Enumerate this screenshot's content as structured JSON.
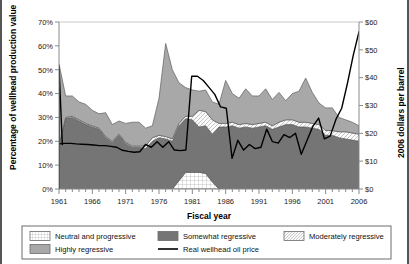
{
  "chart_data": {
    "type": "area",
    "title": "",
    "xlabel": "Fiscal year",
    "ylabel": "Percentage of wellhead production value",
    "y2label": "2006 dollars per barrel",
    "xlim": [
      1961,
      2006
    ],
    "ylim": [
      0,
      70
    ],
    "y2lim": [
      0,
      60
    ],
    "ytick_labels": [
      "0%",
      "10%",
      "20%",
      "30%",
      "40%",
      "50%",
      "60%",
      "70%"
    ],
    "ytick_values": [
      0,
      10,
      20,
      30,
      40,
      50,
      60,
      70
    ],
    "y2tick_labels": [
      "$0",
      "$10",
      "$20",
      "$30",
      "$40",
      "$50",
      "$60"
    ],
    "y2tick_values": [
      0,
      10,
      20,
      30,
      40,
      50,
      60
    ],
    "xtick_labels": [
      "1961",
      "1966",
      "1971",
      "1976",
      "1981",
      "1986",
      "1991",
      "1996",
      "2001",
      "2006"
    ],
    "xtick_values": [
      1961,
      1966,
      1971,
      1976,
      1981,
      1986,
      1991,
      1996,
      2001,
      2006
    ],
    "grid": false,
    "legend_position": "bottom",
    "stacked": true,
    "x": [
      1961,
      1962,
      1963,
      1964,
      1965,
      1966,
      1967,
      1968,
      1969,
      1970,
      1971,
      1972,
      1973,
      1974,
      1975,
      1976,
      1977,
      1978,
      1979,
      1980,
      1981,
      1982,
      1983,
      1984,
      1985,
      1986,
      1987,
      1988,
      1989,
      1990,
      1991,
      1992,
      1993,
      1994,
      1995,
      1996,
      1997,
      1998,
      1999,
      2000,
      2001,
      2002,
      2003,
      2004,
      2005,
      2006
    ],
    "series": [
      {
        "name": "Neutral and progressive",
        "fill": "#ffffff",
        "pattern": "grid",
        "values": [
          0,
          0,
          0,
          0,
          0,
          0,
          0,
          0,
          0,
          0,
          0,
          0,
          0,
          0,
          0,
          0,
          0,
          0,
          3.5,
          7,
          7,
          7,
          6.5,
          3,
          0,
          0,
          0,
          0,
          0,
          0,
          0,
          0,
          0,
          0,
          0,
          0,
          0,
          0,
          0,
          0,
          0,
          0,
          0,
          0,
          0,
          0
        ]
      },
      {
        "name": "Somewhat regressive",
        "fill": "#757575",
        "pattern": "solid",
        "values": [
          18,
          29.5,
          30,
          28.5,
          27,
          26,
          25,
          21.5,
          19.5,
          22.5,
          19,
          17.5,
          17.5,
          17,
          20,
          21.5,
          21,
          20,
          23,
          22.5,
          22,
          19,
          20,
          20,
          26,
          26,
          26.5,
          25.5,
          26,
          25.5,
          26,
          26.5,
          25,
          26,
          27,
          27,
          26,
          26,
          25.5,
          25,
          22.5,
          22.5,
          21.5,
          21,
          20.5,
          20
        ]
      },
      {
        "name": "Moderately regressive",
        "fill": "#f2f2f2",
        "pattern": "hatch",
        "values": [
          0.5,
          0.5,
          0.5,
          0.5,
          0.5,
          0.5,
          0.5,
          0.5,
          0.5,
          0.5,
          0.5,
          0.5,
          0.5,
          1,
          1.5,
          1,
          1,
          1,
          1,
          1,
          1.5,
          7,
          6,
          6,
          1.5,
          1.5,
          1.5,
          1.5,
          1.5,
          1.5,
          1.5,
          1.5,
          1.5,
          2,
          2,
          2,
          2,
          2,
          2,
          2,
          2,
          2,
          2.5,
          3,
          3,
          3
        ]
      },
      {
        "name": "Highly regressive",
        "fill": "#a8a8a8",
        "pattern": "solid",
        "values": [
          34,
          9,
          8.5,
          7.5,
          8,
          6.5,
          6,
          10,
          7,
          5.5,
          8,
          10,
          10,
          7.5,
          5,
          15.5,
          39,
          29,
          17,
          12,
          11,
          8,
          9,
          7.5,
          8,
          18,
          12,
          11,
          14.5,
          12,
          11.5,
          14,
          11,
          12.5,
          8,
          11,
          13,
          18.5,
          13,
          9,
          9.5,
          9.5,
          6,
          5,
          4.5,
          3.5
        ]
      }
    ],
    "line_series": {
      "name": "Real wellhead oil price",
      "color": "#000000",
      "axis": "right",
      "values": [
        16.2,
        16.4,
        16.4,
        16.2,
        16.1,
        16.0,
        15.8,
        15.6,
        15.6,
        15.3,
        15.0,
        13.9,
        13.5,
        13.2,
        13.4,
        16.0,
        15.0,
        17.0,
        15.0,
        17.0,
        14.0,
        13.8,
        14.0,
        40.5,
        40.5,
        39.0,
        36.5,
        34.0,
        29.5,
        29.0,
        11.0,
        17.5,
        14.0,
        16.0,
        14.5,
        15.0,
        21.5,
        17.0,
        16.5,
        19.5,
        18.5,
        20.0,
        12.5,
        17.5,
        22.5,
        25.5,
        18.0,
        19.0,
        25.0,
        29.0,
        38.0,
        48.0,
        56.5
      ]
    }
  },
  "legend": {
    "items": [
      {
        "label": "Neutral and progressive",
        "swatch": "neutral-swatch"
      },
      {
        "label": "Somewhat regressive",
        "swatch": "somewhat-swatch"
      },
      {
        "label": "Moderately regressive",
        "swatch": "moderately-swatch"
      },
      {
        "label": "Highly regressive",
        "swatch": "highly-swatch"
      },
      {
        "label": "Real wellhead oil price",
        "swatch": "line-swatch"
      }
    ]
  },
  "colors": {
    "neutral": "#ffffff",
    "somewhat": "#757575",
    "moderately": "#f2f2f2",
    "highly": "#a8a8a8",
    "oil_price_line": "#000000",
    "axis": "#8a8a8a",
    "frame": "#555555"
  }
}
